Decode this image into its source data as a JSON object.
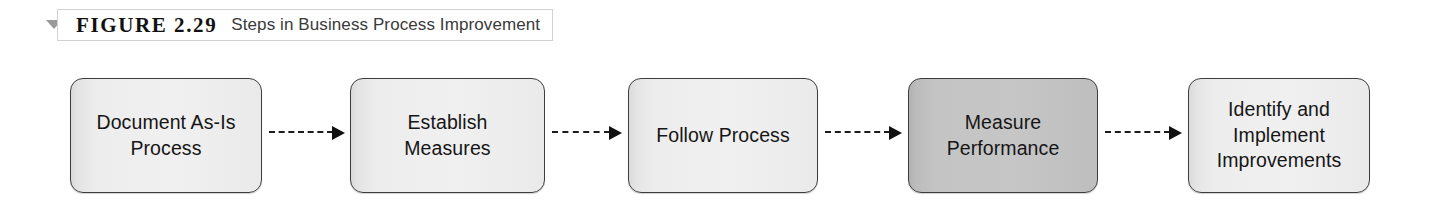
{
  "figure": {
    "marker_icon": "triangle-down-icon",
    "label": "FIGURE 2.29",
    "title": "Steps in Business Process Improvement"
  },
  "diagram": {
    "type": "process-flow",
    "orientation": "left-to-right",
    "connector_style": "dashed-arrow",
    "highlight_color": "#c4c4c4",
    "default_color": "#f0f0f0",
    "border_color": "#3d3d3d",
    "nodes": [
      {
        "id": "document-as-is-process",
        "label": "Document As-Is\nProcess",
        "highlighted": false,
        "left": 70,
        "width": 192
      },
      {
        "id": "establish-measures",
        "label": "Establish\nMeasures",
        "highlighted": false,
        "left": 350,
        "width": 195
      },
      {
        "id": "follow-process",
        "label": "Follow Process",
        "highlighted": false,
        "left": 628,
        "width": 190
      },
      {
        "id": "measure-performance",
        "label": "Measure\nPerformance",
        "highlighted": true,
        "left": 908,
        "width": 190
      },
      {
        "id": "identify-and-implement",
        "label": "Identify and\nImplement\nImprovements",
        "highlighted": false,
        "left": 1188,
        "width": 182
      }
    ],
    "connectors": [
      {
        "id": "arrow-1",
        "from": "document-as-is-process",
        "to": "establish-measures",
        "left": 269,
        "width": 76
      },
      {
        "id": "arrow-2",
        "from": "establish-measures",
        "to": "follow-process",
        "left": 552,
        "width": 70
      },
      {
        "id": "arrow-3",
        "from": "follow-process",
        "to": "measure-performance",
        "left": 825,
        "width": 77
      },
      {
        "id": "arrow-4",
        "from": "measure-performance",
        "to": "identify-and-implement",
        "left": 1105,
        "width": 77
      }
    ]
  }
}
